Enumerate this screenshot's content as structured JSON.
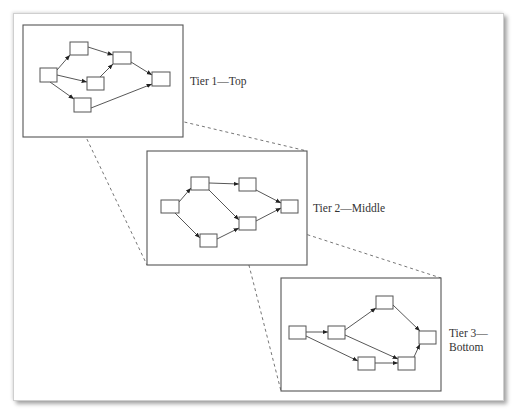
{
  "diagram": {
    "tiers": [
      {
        "id": "tier1",
        "label_lines": [
          "Tier 1—Top"
        ]
      },
      {
        "id": "tier2",
        "label_lines": [
          "Tier 2—Middle"
        ]
      },
      {
        "id": "tier3",
        "label_lines": [
          "Tier 3—",
          "Bottom"
        ]
      }
    ],
    "colors": {
      "stroke": "#555555",
      "background": "#ffffff"
    }
  }
}
